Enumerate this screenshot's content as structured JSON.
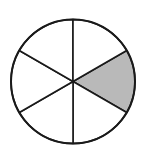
{
  "diagram": {
    "type": "fraction-circle",
    "total_sectors": 6,
    "shaded_sectors": 1,
    "shaded_sector_index": 0,
    "colors": {
      "fill_shaded": "#b9b9b9",
      "fill_unshaded": "#ffffff",
      "stroke": "#1a1a1a"
    },
    "geometry": {
      "cx": 73,
      "cy": 81.5,
      "r": 62,
      "start_angle_deg": -30
    }
  }
}
